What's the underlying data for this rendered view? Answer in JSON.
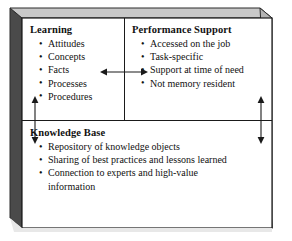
{
  "diagram": {
    "style": {
      "front_face_fill": "#ffffff",
      "top_face_fill": "#c9c9c9",
      "side_face_fill": "#4a4a4a",
      "line_color": "#1a1a1a",
      "text_color": "#111111"
    },
    "panels": {
      "learning": {
        "title": "Learning",
        "bullets": [
          "Attitudes",
          "Concepts",
          "Facts",
          "Processes",
          "Procedures"
        ]
      },
      "performance_support": {
        "title": "Performance Support",
        "bullets": [
          "Accessed on the job",
          "Task-specific",
          "Support at time of need",
          "Not memory resident"
        ]
      },
      "knowledge_base": {
        "title": "Knowledge Base",
        "bullets": [
          "Repository of knowledge objects",
          "Sharing of best practices and lessons learned",
          "Connection to experts and high-value information"
        ]
      }
    },
    "connectors": [
      {
        "name": "learning-performance-link",
        "orientation": "horizontal",
        "heads": "double",
        "label": ""
      },
      {
        "name": "left-knowledge-base-link",
        "orientation": "vertical",
        "heads": "double",
        "label": ""
      },
      {
        "name": "right-knowledge-base-link",
        "orientation": "vertical",
        "heads": "double",
        "label": ""
      }
    ]
  }
}
